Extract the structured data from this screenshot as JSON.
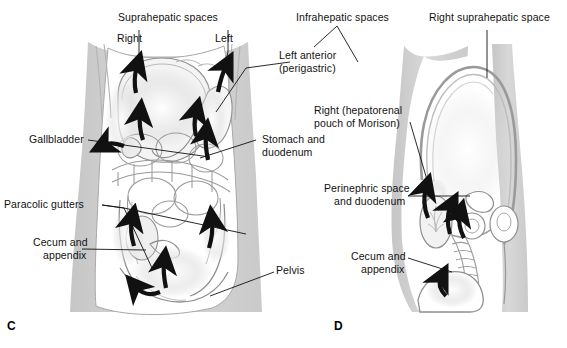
{
  "figure": {
    "type": "medical-illustration",
    "title_panels": [
      "C",
      "D"
    ],
    "background_color": "#ffffff",
    "body_fill_color": "#d2d2d2",
    "organ_line_color": "#8c8c8c",
    "arrow_color": "#111111",
    "label_color": "#111111"
  },
  "panel_c": {
    "letter": "C",
    "view": "coronal anterior abdominal view",
    "labels": {
      "suprahepatic_spaces": "Suprahepatic spaces",
      "right": "Right",
      "left": "Left",
      "gallbladder": "Gallbladder",
      "paracolic_gutters": "Paracolic gutters",
      "cecum_and_appendix_line1": "Cecum and",
      "cecum_and_appendix_line2": "appendix",
      "stomach_and_duodenum_line1": "Stomach and",
      "stomach_and_duodenum_line2": "duodenum",
      "pelvis": "Pelvis"
    }
  },
  "shared_labels": {
    "infrahepatic_spaces": "Infrahepatic spaces",
    "left_anterior_line1": "Left anterior",
    "left_anterior_line2": "(perigastric)",
    "right_hepatorenal_line1": "Right (hepatorenal",
    "right_hepatorenal_line2": "pouch of Morison)"
  },
  "panel_d": {
    "letter": "D",
    "view": "sagittal view",
    "labels": {
      "right_suprahepatic_space": "Right suprahepatic space",
      "perinephric_space_line1": "Perinephric space",
      "perinephric_space_line2": "and duodenum",
      "cecum_and_appendix_line1": "Cecum and",
      "cecum_and_appendix_line2": "appendix"
    }
  }
}
